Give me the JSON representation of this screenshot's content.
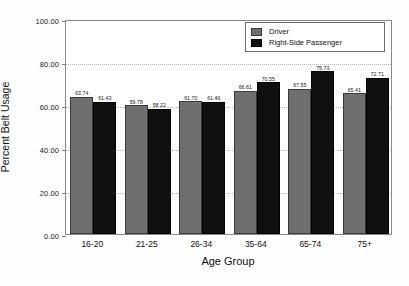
{
  "chart_data": {
    "type": "bar",
    "title": "",
    "xlabel": "Age Group",
    "ylabel": "Percent Belt Usage",
    "categories": [
      "16-20",
      "21-25",
      "26-34",
      "35-64",
      "65-74",
      "75+"
    ],
    "series": [
      {
        "name": "Driver",
        "color": "#6f6f6f",
        "values": [
          63.74,
          59.78,
          61.7,
          66.61,
          67.55,
          65.41
        ],
        "labels": [
          "63.74",
          "59.78",
          "61.70",
          "66.61",
          "67.55",
          "65.41"
        ]
      },
      {
        "name": "Right-Side Passenger",
        "color": "#101010",
        "values": [
          61.43,
          58.22,
          61.46,
          70.55,
          75.73,
          72.71
        ],
        "labels": [
          "61.43",
          "58.22",
          "61.46",
          "70.55",
          "75.73",
          "72.71"
        ]
      }
    ],
    "ylim": [
      0,
      100
    ],
    "yticks": [
      0,
      20,
      40,
      60,
      80,
      100
    ],
    "ytick_labels": [
      "0.00",
      "20.00",
      "40.00",
      "60.00",
      "80.00",
      "100.00"
    ],
    "grid": true,
    "legend_position": "top-right"
  },
  "legend": {
    "entries": [
      {
        "label": "Driver"
      },
      {
        "label": "Right-Side Passenger"
      }
    ]
  }
}
